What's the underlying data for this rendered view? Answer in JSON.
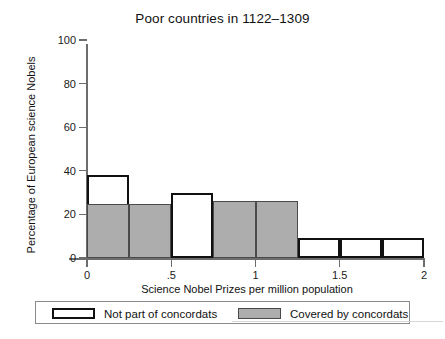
{
  "chart_data": {
    "type": "bar",
    "title": "Poor countries in 1122–1309",
    "xlabel": "Science Nobel Prizes per million population",
    "ylabel": "Percentage of European science Nobels",
    "xlim": [
      0,
      2
    ],
    "ylim": [
      0,
      100
    ],
    "grid": false,
    "bin_width": 0.25,
    "xticks": [
      "0",
      ".5",
      "1",
      "1.5",
      "2"
    ],
    "xtick_values": [
      0,
      0.5,
      1,
      1.5,
      2
    ],
    "yticks": [
      "0",
      "20",
      "40",
      "60",
      "80",
      "100"
    ],
    "ytick_values": [
      0,
      20,
      40,
      60,
      80,
      100
    ],
    "legend_position": "below-axis",
    "series": [
      {
        "name": "Not part of concordats",
        "fill": "#ffffff",
        "edge": "#111111",
        "values": [
          38,
          null,
          30,
          null,
          null,
          9,
          9,
          9
        ]
      },
      {
        "name": "Covered by concordats",
        "fill": "#adadad",
        "edge": "#4a4a4a",
        "values": [
          25,
          25,
          null,
          26,
          26,
          null,
          null,
          null
        ]
      }
    ],
    "bins": [
      {
        "x0": 0.0,
        "x1": 0.25,
        "covered": 25,
        "notpart": 38
      },
      {
        "x0": 0.25,
        "x1": 0.5,
        "covered": 25,
        "notpart": null
      },
      {
        "x0": 0.5,
        "x1": 0.75,
        "covered": null,
        "notpart": 30
      },
      {
        "x0": 0.75,
        "x1": 1.0,
        "covered": 26,
        "notpart": null
      },
      {
        "x0": 1.0,
        "x1": 1.25,
        "covered": 26,
        "notpart": null
      },
      {
        "x0": 1.25,
        "x1": 1.5,
        "covered": null,
        "notpart": 9
      },
      {
        "x0": 1.5,
        "x1": 1.75,
        "covered": null,
        "notpart": 9
      },
      {
        "x0": 1.75,
        "x1": 2.0,
        "covered": null,
        "notpart": 9
      }
    ]
  },
  "legend": {
    "entries": [
      {
        "label": "Not part of concordats",
        "style": "notpart"
      },
      {
        "label": "Covered by concordats",
        "style": "covered"
      }
    ]
  },
  "bottom_caption": ""
}
